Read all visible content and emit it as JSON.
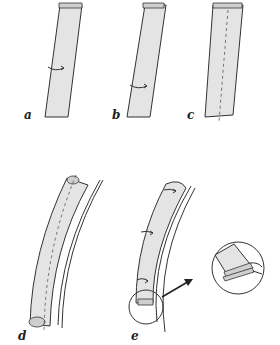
{
  "figure": {
    "fill_color": "#e4e4e4",
    "stroke_color": "#333333",
    "panels": [
      {
        "id": "a",
        "label": "a",
        "icon": "fold-arrow-icon"
      },
      {
        "id": "b",
        "label": "b",
        "icon": "fold-arrow-icon"
      },
      {
        "id": "c",
        "label": "c",
        "icon": "dashed-seam-line"
      },
      {
        "id": "d",
        "label": "d",
        "icon": "dashed-seam-line"
      },
      {
        "id": "e",
        "label": "e",
        "icon": "fold-arrow-icon"
      }
    ],
    "detail_callout": {
      "icon": "magnify-circle",
      "arrow": "pointer-arrow-icon"
    }
  }
}
